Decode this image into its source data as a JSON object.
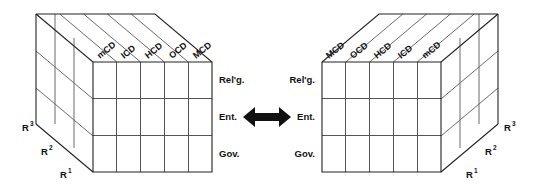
{
  "figure": {
    "background_color": "#ffffff",
    "line_color": "#3a3a3a",
    "arrow_color": "#111111"
  },
  "arrow": {
    "name": "bidirectional-arrow",
    "direction": "left-right",
    "color": "#111111"
  },
  "cubes": [
    {
      "id": "left-cube",
      "position": "left",
      "columns": [
        "mCD",
        "ICD",
        "HCD",
        "OCD",
        "MCD"
      ],
      "rows": [
        "Rel'g.",
        "Ent.",
        "Gov."
      ],
      "depth_labels": [
        {
          "base": "R",
          "exp": "3"
        },
        {
          "base": "R",
          "exp": "2"
        },
        {
          "base": "R",
          "exp": "1"
        }
      ],
      "row_label_side": "right",
      "depth_label_side": "left",
      "grid": {
        "cols": 5,
        "rows": 3,
        "depth": 3
      }
    },
    {
      "id": "right-cube",
      "position": "right",
      "columns": [
        "MCD",
        "OCD",
        "HCD",
        "ICD",
        "mCD"
      ],
      "rows": [
        "Rel'g.",
        "Ent.",
        "Gov."
      ],
      "depth_labels": [
        {
          "base": "R",
          "exp": "3"
        },
        {
          "base": "R",
          "exp": "2"
        },
        {
          "base": "R",
          "exp": "1"
        }
      ],
      "row_label_side": "left",
      "depth_label_side": "right",
      "grid": {
        "cols": 5,
        "rows": 3,
        "depth": 3
      }
    }
  ]
}
